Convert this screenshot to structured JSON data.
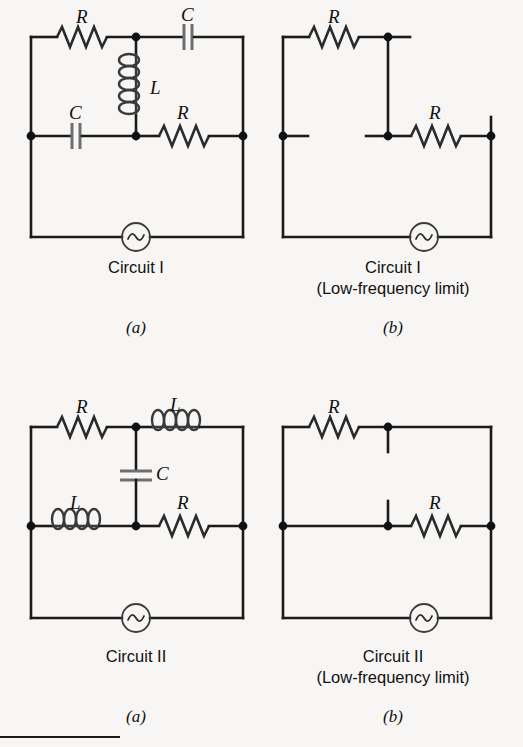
{
  "figure": {
    "background_color": "#f7f6f4",
    "ink_color": "#1b1b1b",
    "component_gray": "#6e6e6e"
  },
  "panels": [
    {
      "id": "circuit-1-full",
      "caption": "Circuit I",
      "subcaption": "(a)",
      "labels": {
        "top_left": "R",
        "top_right": "C",
        "middle_vertical": "L",
        "middle_left": "C",
        "middle_right": "R"
      }
    },
    {
      "id": "circuit-1-low-freq",
      "caption": "Circuit I\n(Low-frequency limit)",
      "subcaption": "(b)",
      "labels": {
        "top_left": "R",
        "middle_right": "R"
      }
    },
    {
      "id": "circuit-2-full",
      "caption": "Circuit II",
      "subcaption": "(a)",
      "labels": {
        "top_left": "R",
        "top_right": "L",
        "middle_vertical": "C",
        "middle_left": "L",
        "middle_right": "R"
      }
    },
    {
      "id": "circuit-2-low-freq",
      "caption": "Circuit II\n(Low-frequency limit)",
      "subcaption": "(b)",
      "labels": {
        "top_left": "R",
        "middle_right": "R"
      }
    }
  ],
  "components": {
    "resistor_name": "resistor",
    "capacitor_name": "capacitor",
    "inductor_name": "inductor",
    "ac_source_name": "ac-source",
    "node_name": "junction-node"
  }
}
